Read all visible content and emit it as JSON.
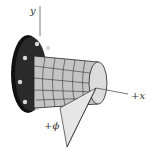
{
  "diagram": {
    "labels": {
      "y_axis": "y",
      "x_axis": "+x",
      "angle": "+ϕ"
    },
    "colors": {
      "flange": "#1e1e1e",
      "bolt_holes": "#d8d8d8",
      "shaft": "#c9c9c9",
      "grid_lines": "#333333",
      "end_face": "#dcdcdc",
      "wedge": "#e6e6e6",
      "axis": "#555555"
    }
  }
}
